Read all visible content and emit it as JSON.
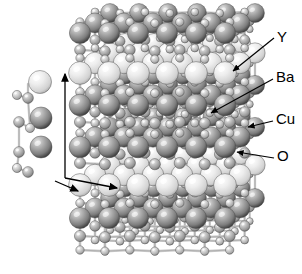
{
  "figure": {
    "kind": "crystal-structure-diagram",
    "compound": "YBa2Cu3O7",
    "background_color": "#ffffff",
    "view": "perspective ball-and-stick supercell"
  },
  "labels": [
    {
      "id": "y",
      "text": "Y",
      "x": 277,
      "y": 42,
      "leader": {
        "x1": 274,
        "x2": 233,
        "y1": 38,
        "y2": 71
      }
    },
    {
      "id": "ba",
      "text": "Ba",
      "x": 276,
      "y": 82,
      "leader": {
        "x1": 273,
        "x2": 211,
        "y1": 79,
        "y2": 113
      }
    },
    {
      "id": "cu",
      "text": "Cu",
      "x": 276,
      "y": 124,
      "leader": {
        "x1": 273,
        "x2": 248,
        "y1": 121,
        "y2": 127
      }
    },
    {
      "id": "o",
      "text": "O",
      "x": 277,
      "y": 161,
      "leader": {
        "x1": 274,
        "x2": 237,
        "y1": 158,
        "y2": 152
      }
    }
  ],
  "atom_species": [
    {
      "id": "y",
      "label": "Y",
      "color": "#ececec",
      "highlight": "#fbfbfb",
      "shadow": "#b4b4b4",
      "radius": 11.5
    },
    {
      "id": "ba",
      "label": "Ba",
      "color": "#9a9a9a",
      "highlight": "#d8d8d8",
      "shadow": "#3c3c3c",
      "radius": 11.0
    },
    {
      "id": "cu",
      "label": "Cu",
      "color": "#b0b0b0",
      "highlight": "#e2e2e2",
      "shadow": "#5a5a5a",
      "radius": 5.6
    },
    {
      "id": "o",
      "label": "O",
      "color": "#c4c4c4",
      "highlight": "#efefef",
      "shadow": "#6e6e6e",
      "radius": 4.2
    }
  ],
  "axes": {
    "c_axis": {
      "name": "c-axis-arrow",
      "x1": 65,
      "y1": 178,
      "x2": 65,
      "y2": 74
    },
    "a_axis": {
      "name": "a-axis-arrow",
      "x1": 65,
      "y1": 178,
      "x2": 117,
      "y2": 188
    },
    "b_axis": {
      "name": "b-axis-arrow",
      "x1": 55,
      "y1": 181,
      "x2": 78,
      "y2": 191
    },
    "color": "#000000"
  },
  "inset_cell": {
    "name": "unit-cell-column",
    "x": 12,
    "y": 68,
    "width": 48,
    "height": 114,
    "atoms": [
      {
        "species": "y",
        "cx": 40,
        "cy": 82,
        "r": 11.5
      },
      {
        "species": "o",
        "cx": 17,
        "cy": 95,
        "r": 4.6
      },
      {
        "species": "cu",
        "cx": 28,
        "cy": 98,
        "r": 5.4
      },
      {
        "species": "ba",
        "cx": 41,
        "cy": 118,
        "r": 11.0
      },
      {
        "species": "cu",
        "cx": 19,
        "cy": 122,
        "r": 5.4
      },
      {
        "species": "o",
        "cx": 30,
        "cy": 128,
        "r": 4.6
      },
      {
        "species": "ba",
        "cx": 41,
        "cy": 147,
        "r": 11.0
      },
      {
        "species": "cu",
        "cx": 19,
        "cy": 152,
        "r": 5.4
      },
      {
        "species": "o",
        "cx": 17,
        "cy": 168,
        "r": 4.6
      },
      {
        "species": "cu",
        "cx": 28,
        "cy": 172,
        "r": 5.4
      }
    ]
  },
  "supercell": {
    "name": "main-crystal-lattice",
    "x": 68,
    "y": 6,
    "width": 180,
    "height": 266,
    "layers": [
      {
        "id": "top-cuo-slab",
        "species_major": "ba",
        "y_top": 10,
        "y_bottom": 62
      },
      {
        "id": "y-plane-upper",
        "species_major": "y",
        "y_top": 64,
        "y_bottom": 86
      },
      {
        "id": "mid-slab-1",
        "species_major": "ba",
        "y_top": 88,
        "y_bottom": 140
      },
      {
        "id": "mid-slab-2",
        "species_major": "ba",
        "y_top": 130,
        "y_bottom": 176
      },
      {
        "id": "y-plane-lower",
        "species_major": "y",
        "y_top": 176,
        "y_bottom": 198
      },
      {
        "id": "bottom-slab",
        "species_major": "ba",
        "y_top": 198,
        "y_bottom": 268
      }
    ],
    "grid": {
      "cols": 6,
      "depth_rows": 4,
      "dx": 31,
      "dy": 17,
      "skew_x": -9,
      "skew_y": -12
    }
  }
}
